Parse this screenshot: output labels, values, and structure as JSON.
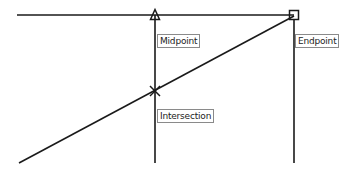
{
  "canvas": {
    "width": 346,
    "height": 171,
    "background": "#ffffff",
    "stroke": "#1a1a1a"
  },
  "lines": [
    {
      "name": "horizontal-line",
      "x1": 17,
      "y1": 15,
      "x2": 294,
      "y2": 15
    },
    {
      "name": "diagonal-line",
      "x1": 19,
      "y1": 163,
      "x2": 294,
      "y2": 16
    },
    {
      "name": "vertical-line-midpoint",
      "x1": 155,
      "y1": 15,
      "x2": 155,
      "y2": 163
    },
    {
      "name": "vertical-line-endpoint",
      "x1": 294,
      "y1": 20,
      "x2": 294,
      "y2": 163
    }
  ],
  "markers": {
    "midpoint": {
      "shape": "triangle",
      "x": 155,
      "y": 15
    },
    "endpoint": {
      "shape": "square",
      "x": 294,
      "y": 15
    },
    "intersection": {
      "shape": "x-cross",
      "x": 155,
      "y": 91
    }
  },
  "labels": {
    "midpoint": "Midpoint",
    "endpoint": "Endpoint",
    "intersection": "Intersection"
  }
}
